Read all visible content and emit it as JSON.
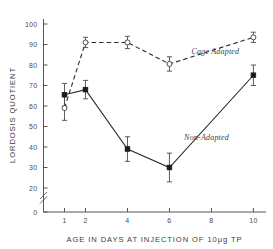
{
  "chart_data": {
    "type": "line",
    "title": "",
    "xlabel": "AGE IN DAYS AT INJECTION OF 10μg TP",
    "ylabel": "LORDOSIS QUOTIENT",
    "x": [
      1,
      2,
      4,
      6,
      10
    ],
    "xlim": [
      0,
      10.6
    ],
    "ylim": [
      0,
      100
    ],
    "y_axis_break": {
      "from": 0,
      "to": 20,
      "symbol": "double-slash"
    },
    "xticks": [
      1,
      2,
      4,
      6,
      8,
      10
    ],
    "xtick_labels": [
      "1",
      "2",
      "4",
      "6",
      "8",
      "10"
    ],
    "yticks": [
      0,
      20,
      30,
      40,
      50,
      60,
      70,
      80,
      90,
      100
    ],
    "ytick_labels": [
      "0",
      "20",
      "30",
      "40",
      "50",
      "60",
      "70",
      "80",
      "90",
      "100"
    ],
    "grid": false,
    "legend_position": "inline-annotation",
    "series": [
      {
        "name": "Cage Adapted",
        "marker": "open-circle",
        "linestyle": "dashed",
        "label_x": 7.05,
        "label_y": 85.5,
        "x": [
          1,
          2,
          4,
          6,
          10
        ],
        "values": [
          59,
          91,
          91,
          80.5,
          93.5
        ],
        "err_low": [
          6,
          2.5,
          3,
          3.5,
          2.5
        ],
        "err_high": [
          6,
          2.5,
          3,
          3.5,
          2.5
        ]
      },
      {
        "name": "Non-Adapted",
        "marker": "filled-square",
        "linestyle": "solid",
        "label_x": 6.7,
        "label_y": 43.5,
        "x": [
          1,
          2,
          4,
          6,
          10
        ],
        "values": [
          65.5,
          68,
          39,
          30,
          75
        ],
        "err_low": [
          5.5,
          4.5,
          6,
          7,
          5
        ],
        "err_high": [
          5.5,
          4.5,
          6,
          7,
          5
        ]
      }
    ]
  }
}
